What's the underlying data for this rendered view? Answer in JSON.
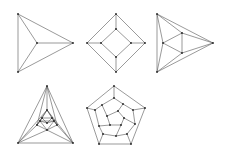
{
  "figure": {
    "colors": {
      "edge": "#555555",
      "vertex": "#222222",
      "background": "#ffffff"
    },
    "graphs": [
      {
        "name": "tetrahedron",
        "vertices": [
          [
            18,
            14
          ],
          [
            73,
            43
          ],
          [
            18,
            72
          ],
          [
            37,
            43
          ]
        ],
        "edges": [
          [
            0,
            1
          ],
          [
            1,
            2
          ],
          [
            2,
            0
          ],
          [
            3,
            0
          ],
          [
            3,
            1
          ],
          [
            3,
            2
          ]
        ]
      },
      {
        "name": "cube",
        "vertices": [
          [
            116,
            14
          ],
          [
            145,
            43
          ],
          [
            116,
            72
          ],
          [
            87,
            43
          ],
          [
            116,
            29
          ],
          [
            131,
            43
          ],
          [
            116,
            57
          ],
          [
            101,
            43
          ]
        ],
        "edges": [
          [
            0,
            1
          ],
          [
            1,
            2
          ],
          [
            2,
            3
          ],
          [
            3,
            0
          ],
          [
            4,
            5
          ],
          [
            5,
            6
          ],
          [
            6,
            7
          ],
          [
            7,
            4
          ],
          [
            0,
            4
          ],
          [
            1,
            5
          ],
          [
            2,
            6
          ],
          [
            3,
            7
          ]
        ]
      },
      {
        "name": "octahedron",
        "vertices": [
          [
            157,
            14
          ],
          [
            213,
            43
          ],
          [
            157,
            72
          ],
          [
            163,
            43
          ],
          [
            182,
            33
          ],
          [
            182,
            53
          ]
        ],
        "edges": [
          [
            0,
            1
          ],
          [
            1,
            2
          ],
          [
            2,
            0
          ],
          [
            3,
            4
          ],
          [
            4,
            5
          ],
          [
            5,
            3
          ],
          [
            0,
            3
          ],
          [
            2,
            3
          ],
          [
            0,
            4
          ],
          [
            1,
            4
          ],
          [
            1,
            5
          ],
          [
            2,
            5
          ]
        ]
      },
      {
        "name": "icosahedron",
        "vertices": [
          [
            47,
            86
          ],
          [
            18,
            143
          ],
          [
            73,
            143
          ],
          [
            47,
            110
          ],
          [
            37,
            125
          ],
          [
            57,
            125
          ],
          [
            42,
            118
          ],
          [
            52,
            118
          ],
          [
            47,
            130
          ],
          [
            40,
            121
          ],
          [
            54,
            121
          ],
          [
            47,
            123
          ]
        ],
        "edges": [
          [
            0,
            1
          ],
          [
            1,
            2
          ],
          [
            2,
            0
          ],
          [
            0,
            3
          ],
          [
            0,
            4
          ],
          [
            0,
            5
          ],
          [
            1,
            4
          ],
          [
            1,
            8
          ],
          [
            2,
            5
          ],
          [
            2,
            8
          ],
          [
            1,
            3
          ],
          [
            2,
            3
          ],
          [
            3,
            4
          ],
          [
            4,
            8
          ],
          [
            8,
            5
          ],
          [
            5,
            3
          ],
          [
            3,
            6
          ],
          [
            3,
            7
          ],
          [
            4,
            6
          ],
          [
            4,
            9
          ],
          [
            5,
            7
          ],
          [
            5,
            10
          ],
          [
            8,
            9
          ],
          [
            8,
            10
          ],
          [
            6,
            7
          ],
          [
            7,
            10
          ],
          [
            10,
            9
          ],
          [
            9,
            6
          ],
          [
            6,
            11
          ],
          [
            7,
            11
          ],
          [
            10,
            11
          ],
          [
            9,
            11
          ]
        ]
      },
      {
        "name": "dodecahedron",
        "vertices": [
          [
            114,
            86
          ],
          [
            145,
            108
          ],
          [
            131,
            144
          ],
          [
            99,
            144
          ],
          [
            87,
            108
          ],
          [
            114,
            98
          ],
          [
            133,
            110
          ],
          [
            127,
            134
          ],
          [
            103,
            134
          ],
          [
            95,
            110
          ],
          [
            123,
            104
          ],
          [
            135,
            124
          ],
          [
            116,
            136
          ],
          [
            99,
            126
          ],
          [
            102,
            105
          ],
          [
            118,
            111
          ],
          [
            124,
            118
          ],
          [
            121,
            125
          ],
          [
            110,
            125
          ],
          [
            107,
            116
          ]
        ],
        "edges": [
          [
            0,
            1
          ],
          [
            1,
            2
          ],
          [
            2,
            3
          ],
          [
            3,
            4
          ],
          [
            4,
            0
          ],
          [
            0,
            5
          ],
          [
            1,
            6
          ],
          [
            2,
            7
          ],
          [
            3,
            8
          ],
          [
            4,
            9
          ],
          [
            5,
            10
          ],
          [
            10,
            6
          ],
          [
            6,
            11
          ],
          [
            11,
            7
          ],
          [
            7,
            12
          ],
          [
            12,
            8
          ],
          [
            8,
            13
          ],
          [
            13,
            9
          ],
          [
            9,
            14
          ],
          [
            14,
            5
          ],
          [
            10,
            15
          ],
          [
            11,
            16
          ],
          [
            12,
            17
          ],
          [
            13,
            18
          ],
          [
            14,
            19
          ],
          [
            15,
            16
          ],
          [
            16,
            17
          ],
          [
            17,
            18
          ],
          [
            18,
            19
          ],
          [
            19,
            15
          ]
        ]
      }
    ]
  }
}
